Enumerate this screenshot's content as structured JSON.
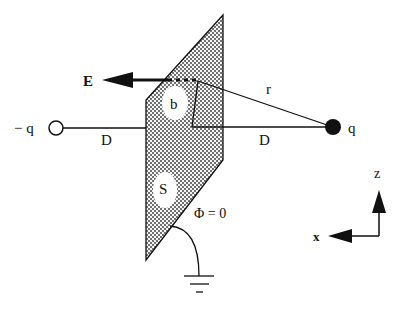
{
  "diagram": {
    "type": "physics-image-charge",
    "labels": {
      "field": "E",
      "neg_charge": "− q",
      "pos_charge": "q",
      "distance_left": "D",
      "distance_right": "D",
      "radius": "r",
      "offset": "b",
      "surface": "S",
      "potential": "Φ = 0",
      "axis_z": "z",
      "axis_x": "x"
    },
    "colors": {
      "stroke": "#111111",
      "plate_fill": "#f4f4f4",
      "plate_dots": "#333333",
      "background": "#ffffff"
    },
    "elements": [
      {
        "name": "grounded conducting plane",
        "label": "S"
      },
      {
        "name": "point charge",
        "label": "q",
        "filled": true
      },
      {
        "name": "image charge",
        "label": "− q",
        "filled": false
      },
      {
        "name": "electric field vector",
        "label": "E"
      },
      {
        "name": "ground symbol"
      },
      {
        "name": "coordinate axes",
        "axes": [
          "z",
          "x"
        ]
      }
    ]
  }
}
